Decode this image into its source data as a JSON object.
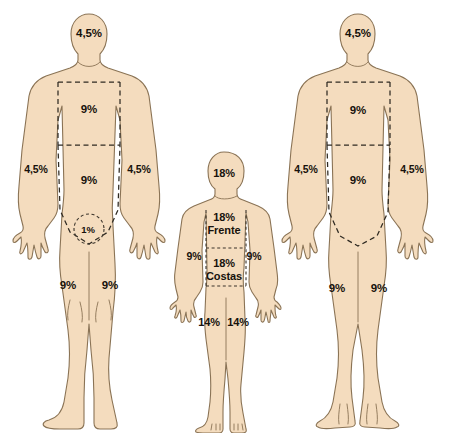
{
  "diagram": {
    "colors": {
      "skin_fill": "#f4dcbe",
      "outline": "#8a7355",
      "divider": "#2f2a22",
      "background": "#ffffff",
      "text": "#17120c"
    },
    "figures": [
      {
        "id": "adult-front",
        "name": "adult-front-figure",
        "labels": [
          {
            "name": "head-label",
            "text": "4,5%",
            "x": 89,
            "y": 33,
            "size": "size-adult"
          },
          {
            "name": "chest-label",
            "text": "9%",
            "x": 89,
            "y": 109,
            "size": "size-adult"
          },
          {
            "name": "abdomen-label",
            "text": "9%",
            "x": 89,
            "y": 180,
            "size": "size-adult"
          },
          {
            "name": "left-arm-label",
            "text": "4,5%",
            "x": 36,
            "y": 170,
            "size": "size-small"
          },
          {
            "name": "right-arm-label",
            "text": "4,5%",
            "x": 139,
            "y": 170,
            "size": "size-small"
          },
          {
            "name": "genital-label",
            "text": "1%",
            "x": 88,
            "y": 230,
            "size": "size-tiny"
          },
          {
            "name": "left-leg-label",
            "text": "9%",
            "x": 68,
            "y": 285,
            "size": "size-adult"
          },
          {
            "name": "right-leg-label",
            "text": "9%",
            "x": 110,
            "y": 285,
            "size": "size-adult"
          }
        ]
      },
      {
        "id": "child",
        "name": "child-figure",
        "labels": [
          {
            "name": "head-label",
            "text": "18%",
            "x": 224,
            "y": 173,
            "size": "size-child"
          },
          {
            "name": "front-label",
            "text": "18%\nFrente",
            "x": 224,
            "y": 224,
            "size": "size-child"
          },
          {
            "name": "back-label",
            "text": "18%\nCostas",
            "x": 224,
            "y": 270,
            "size": "size-child"
          },
          {
            "name": "left-arm-label",
            "text": "9%",
            "x": 194,
            "y": 257,
            "size": "size-small"
          },
          {
            "name": "right-arm-label",
            "text": "9%",
            "x": 254,
            "y": 257,
            "size": "size-small"
          },
          {
            "name": "left-leg-label",
            "text": "14%",
            "x": 209,
            "y": 322,
            "size": "size-child"
          },
          {
            "name": "right-leg-label",
            "text": "14%",
            "x": 238,
            "y": 322,
            "size": "size-child"
          }
        ]
      },
      {
        "id": "adult-back",
        "name": "adult-back-figure",
        "labels": [
          {
            "name": "head-label",
            "text": "4,5%",
            "x": 358,
            "y": 33,
            "size": "size-adult"
          },
          {
            "name": "upper-back-label",
            "text": "9%",
            "x": 358,
            "y": 110,
            "size": "size-adult"
          },
          {
            "name": "lower-back-label",
            "text": "9%",
            "x": 358,
            "y": 180,
            "size": "size-adult"
          },
          {
            "name": "left-arm-label",
            "text": "4,5%",
            "x": 306,
            "y": 170,
            "size": "size-small"
          },
          {
            "name": "right-arm-label",
            "text": "4,5%",
            "x": 412,
            "y": 170,
            "size": "size-small"
          },
          {
            "name": "left-leg-label",
            "text": "9%",
            "x": 337,
            "y": 288,
            "size": "size-adult"
          },
          {
            "name": "right-leg-label",
            "text": "9%",
            "x": 379,
            "y": 288,
            "size": "size-adult"
          }
        ]
      }
    ]
  }
}
